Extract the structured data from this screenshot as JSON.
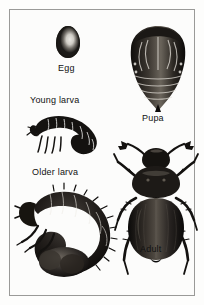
{
  "figure": {
    "style": "black-and-white scanned line illustration",
    "background_color": "#fdfdfc",
    "border_color": "#9a9a98",
    "ink_color": "#111111"
  },
  "stages": [
    {
      "id": "egg",
      "label": "Egg",
      "icon": "beetle-egg-icon",
      "description": "smooth oval egg with highlight"
    },
    {
      "id": "young-larva",
      "label": "Young larva",
      "icon": "young-grub-icon",
      "description": "small C-shaped segmented grub with three pairs of thoracic legs"
    },
    {
      "id": "older-larva",
      "label": "Older larva",
      "icon": "older-grub-icon",
      "description": "large C-curled white grub with bristled segments and swollen abdomen"
    },
    {
      "id": "pupa",
      "label": "Pupa",
      "icon": "beetle-pupa-icon",
      "description": "tapered pupa showing folded wing cases, legs and antennae outlines"
    },
    {
      "id": "adult",
      "label": "Adult",
      "icon": "adult-beetle-icon",
      "description": "dorsal view of scarab beetle with clubbed antennae, elytra and six spiny legs"
    }
  ]
}
